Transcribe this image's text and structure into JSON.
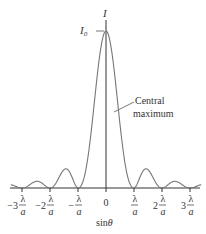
{
  "diagram": {
    "vertical_axis_label": "I",
    "peak_label": "I",
    "peak_label_sub": "0",
    "horizontal_axis_label": "sin",
    "horizontal_axis_symbol": "θ",
    "annotation": {
      "line1": "Central",
      "line2": "maximum"
    },
    "ticks": [
      {
        "coef": "−3",
        "num": "λ",
        "den": "a",
        "value": -3
      },
      {
        "coef": "−2",
        "num": "λ",
        "den": "a",
        "value": -2
      },
      {
        "coef": "−",
        "num": "λ",
        "den": "a",
        "value": -1
      },
      {
        "coef": "0",
        "num": "",
        "den": "",
        "value": 0
      },
      {
        "coef": "",
        "num": "λ",
        "den": "a",
        "value": 1
      },
      {
        "coef": "2",
        "num": "λ",
        "den": "a",
        "value": 2
      },
      {
        "coef": "3",
        "num": "λ",
        "den": "a",
        "value": 3
      }
    ],
    "curve": {
      "function": "I0 * (sin(pi*u)/(pi*u))^2",
      "domain_units_lambda_over_a": [
        -3.4,
        3.4
      ],
      "peak_I0": 1
    },
    "colors": {
      "curve": "#777777",
      "axis": "#333333",
      "text": "#333333"
    }
  }
}
